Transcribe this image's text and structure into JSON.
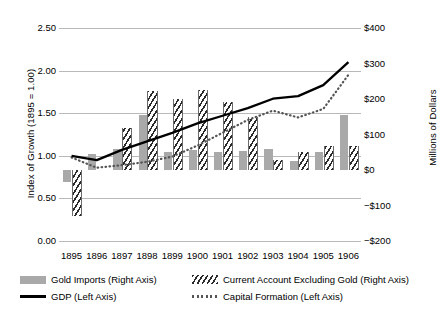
{
  "chart_data": {
    "type": "bar",
    "title": "",
    "subtitle": "",
    "xlabel": "",
    "ylabel": "Index of Growth (1895 = 1.00)",
    "y2label": "Millions of Dollars",
    "categories": [
      "1895",
      "1896",
      "1897",
      "1898",
      "1899",
      "1900",
      "1901",
      "1902",
      "1903",
      "1904",
      "1905",
      "1906"
    ],
    "ylim": [
      0.0,
      2.5
    ],
    "y2lim": [
      -200,
      400
    ],
    "yticks": [
      "0.00",
      "0.50",
      "1.00",
      "1.50",
      "2.00",
      "2.50"
    ],
    "ytick_values": [
      0.0,
      0.5,
      1.0,
      1.5,
      2.0,
      2.5
    ],
    "y2ticks": [
      "−$200",
      "−$100",
      "$0",
      "$100",
      "$200",
      "$300",
      "$400"
    ],
    "y2tick_values": [
      -200,
      -100,
      0,
      100,
      200,
      300,
      400
    ],
    "grid": true,
    "legend_position": "below",
    "series": [
      {
        "name": "Gold Imports (Right Axis)",
        "type": "bar",
        "axis": "right",
        "style": "solid-gray",
        "color": "#a9a9a9",
        "values": [
          -35,
          45,
          58,
          155,
          50,
          57,
          52,
          55,
          58,
          25,
          52,
          155
        ]
      },
      {
        "name": "Current Account Excluding Gold (Right Axis)",
        "type": "bar",
        "axis": "right",
        "style": "hatched",
        "color": "#2b2b2b",
        "values": [
          -130,
          0,
          118,
          222,
          200,
          225,
          192,
          150,
          28,
          52,
          68,
          68
        ]
      },
      {
        "name": "GDP (Left Axis)",
        "type": "line",
        "axis": "left",
        "style": "solid",
        "color": "#000000",
        "values": [
          1.0,
          0.95,
          1.07,
          1.17,
          1.27,
          1.38,
          1.47,
          1.56,
          1.67,
          1.7,
          1.83,
          2.1
        ]
      },
      {
        "name": "Capital Formation (Left Axis)",
        "type": "line",
        "axis": "left",
        "style": "dotted",
        "color": "#555555",
        "values": [
          0.98,
          0.86,
          0.89,
          0.93,
          0.99,
          1.12,
          1.27,
          1.42,
          1.53,
          1.45,
          1.55,
          1.95
        ]
      }
    ]
  },
  "legend": {
    "items": [
      {
        "label": "Gold Imports (Right Axis)",
        "swatch": "gold-imports-swatch"
      },
      {
        "label": "Current Account Excluding Gold (Right Axis)",
        "swatch": "current-account-swatch"
      },
      {
        "label": "GDP (Left Axis)",
        "swatch": "gdp-line-swatch"
      },
      {
        "label": "Capital Formation (Left Axis)",
        "swatch": "capital-formation-line-swatch"
      }
    ]
  },
  "colors": {
    "gold_imports": "#a9a9a9",
    "current_account": "#2b2b2b",
    "gdp": "#000000",
    "capital_formation": "#555555",
    "gridline": "#b9b9b9",
    "background": "#ffffff"
  }
}
